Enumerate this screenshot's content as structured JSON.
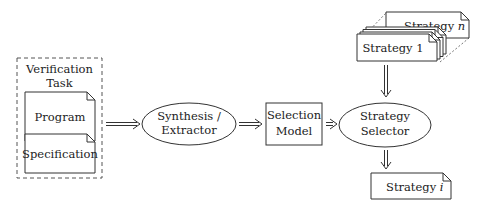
{
  "diagram": {
    "verification_task": {
      "title_line1": "Verification",
      "title_line2": "Task",
      "program": "Program",
      "specification": "Specification"
    },
    "synthesis": {
      "line1": "Synthesis /",
      "line2": "Extractor"
    },
    "selection_model": {
      "line1": "Selection",
      "line2": "Model"
    },
    "strategy_selector": {
      "line1": "Strategy",
      "line2": "Selector"
    },
    "strategy_n": {
      "label": "Strategy",
      "var": "n"
    },
    "strategy_1": {
      "label": "Strategy 1"
    },
    "strategy_i": {
      "label": "Strategy",
      "var": "i"
    },
    "colors": {
      "stroke": "#333333",
      "text": "#222222",
      "background": "#ffffff"
    }
  }
}
